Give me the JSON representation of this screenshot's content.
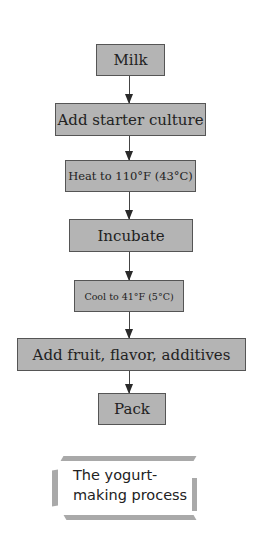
{
  "diagram": {
    "type": "flowchart",
    "direction": "top-to-bottom",
    "steps": [
      {
        "label": "Milk"
      },
      {
        "label": "Add starter culture"
      },
      {
        "label": "Heat to 110°F (43°C)"
      },
      {
        "label": "Incubate"
      },
      {
        "label": "Cool to 41°F (5°C)"
      },
      {
        "label": "Add fruit, flavor, additives"
      },
      {
        "label": "Pack"
      }
    ],
    "caption": "The yogurt-\nmaking process",
    "colors": {
      "box_fill": "#b4b4b4",
      "box_border": "#555555",
      "arrow": "#2a2a2a",
      "caption_frame": "#a9a9a9"
    }
  }
}
